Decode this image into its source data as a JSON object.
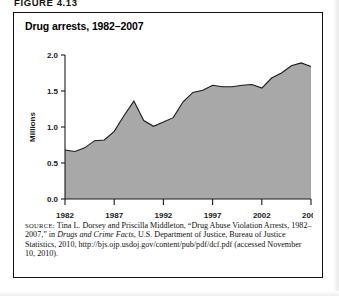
{
  "figure": {
    "label": "FIGURE 4.13",
    "title": "Drug arrests, 1982–2007"
  },
  "source": {
    "prefix": "SOURCE:",
    "line1": " Tina L. Dorsey and Priscilla Middleton, “Drug Abuse Violation Arrests, 1982–2007,” in ",
    "italic1": "Drugs and Crime Facts",
    "line2": ", U.S. Department of Justice, Bureau of Justice Statistics, 2010, http://bjs.ojp.usdoj.gov/content/pub/pdf/dcf.pdf (accessed November 10, 2010)."
  },
  "colors": {
    "area_fill": "#a8a8a8",
    "area_line": "#1a1a1a",
    "axis": "#1a1a1a",
    "border": "#111111",
    "text": "#111111"
  },
  "chart_data": {
    "type": "area",
    "title": "Drug arrests, 1982–2007",
    "xlabel": "",
    "ylabel": "Millions",
    "xlim": [
      1982,
      2007
    ],
    "ylim": [
      0.0,
      2.0
    ],
    "ytick_labels": [
      "0.0",
      "0.5",
      "1.0",
      "1.5",
      "2.0"
    ],
    "ytick_values": [
      0.0,
      0.5,
      1.0,
      1.5,
      2.0
    ],
    "xtick_labels": [
      "1982",
      "1987",
      "1992",
      "1997",
      "2002",
      "2007"
    ],
    "xtick_values": [
      1982,
      1987,
      1992,
      1997,
      2002,
      2007
    ],
    "grid": false,
    "legend": "none",
    "x": [
      1982,
      1983,
      1984,
      1985,
      1986,
      1987,
      1988,
      1989,
      1990,
      1991,
      1992,
      1993,
      1994,
      1995,
      1996,
      1997,
      1998,
      1999,
      2000,
      2001,
      2002,
      2003,
      2004,
      2005,
      2006,
      2007
    ],
    "values": [
      0.68,
      0.66,
      0.71,
      0.81,
      0.82,
      0.94,
      1.16,
      1.36,
      1.09,
      1.01,
      1.07,
      1.13,
      1.35,
      1.48,
      1.51,
      1.58,
      1.56,
      1.56,
      1.58,
      1.59,
      1.54,
      1.68,
      1.75,
      1.85,
      1.89,
      1.84
    ],
    "series": [
      {
        "name": "Drug abuse violation arrests",
        "units": "Millions",
        "values": [
          0.68,
          0.66,
          0.71,
          0.81,
          0.82,
          0.94,
          1.16,
          1.36,
          1.09,
          1.01,
          1.07,
          1.13,
          1.35,
          1.48,
          1.51,
          1.58,
          1.56,
          1.56,
          1.58,
          1.59,
          1.54,
          1.68,
          1.75,
          1.85,
          1.89,
          1.84
        ]
      }
    ]
  }
}
